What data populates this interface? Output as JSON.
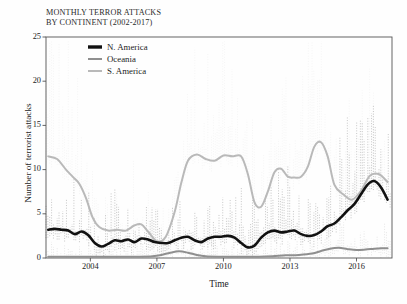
{
  "chart_data": {
    "type": "line",
    "title": "MONTHLY TERROR ATTACKS BY CONTINENT (2002-2017)",
    "title_lines": [
      "MONTHLY TERROR ATTACKS",
      "BY CONTINENT (2002-2017)"
    ],
    "xlabel": "Time",
    "ylabel": "Number of terrorist attacks",
    "xlim": [
      2002.0,
      2017.6
    ],
    "ylim": [
      0,
      25
    ],
    "grid": false,
    "legend_position": "top-left-inside",
    "yticks": [
      0,
      5,
      10,
      15,
      20,
      25
    ],
    "ytick_labels": [
      "0",
      "5",
      "10",
      "15",
      "20",
      "25"
    ],
    "xticks": [
      2004,
      2007,
      2010,
      2013,
      2016
    ],
    "xtick_labels": [
      "2004",
      "2007",
      "2010",
      "2013",
      "2016"
    ],
    "colors": {
      "n_america": "#111111",
      "oceania": "#8f8f8f",
      "s_america": "#b9b9b9",
      "axis": "#555555",
      "raw_na": "#9a9a9a",
      "raw_oc": "#cfcfcf",
      "raw_sa": "#ededed"
    },
    "series": [
      {
        "name": "N. America",
        "color": "#111111",
        "width": 2.6,
        "x": [
          2002.1,
          2002.4,
          2002.7,
          2003.0,
          2003.3,
          2003.6,
          2003.9,
          2004.2,
          2004.5,
          2004.8,
          2005.1,
          2005.4,
          2005.7,
          2006.0,
          2006.3,
          2006.6,
          2006.9,
          2007.2,
          2007.5,
          2007.8,
          2008.1,
          2008.4,
          2008.7,
          2009.0,
          2009.3,
          2009.6,
          2009.9,
          2010.2,
          2010.5,
          2010.8,
          2011.1,
          2011.4,
          2011.7,
          2012.0,
          2012.3,
          2012.6,
          2012.9,
          2013.2,
          2013.5,
          2013.8,
          2014.1,
          2014.4,
          2014.7,
          2015.0,
          2015.3,
          2015.6,
          2015.9,
          2016.2,
          2016.5,
          2016.8,
          2017.1,
          2017.4
        ],
        "y": [
          3.2,
          3.3,
          3.2,
          3.1,
          2.7,
          3.0,
          2.6,
          1.7,
          1.3,
          1.6,
          2.0,
          1.9,
          2.1,
          1.8,
          2.2,
          2.1,
          1.8,
          1.7,
          1.7,
          2.0,
          2.3,
          2.4,
          2.0,
          1.8,
          2.2,
          2.4,
          2.4,
          2.5,
          2.3,
          1.7,
          1.2,
          1.4,
          2.3,
          2.9,
          3.1,
          2.9,
          3.0,
          3.1,
          2.7,
          2.5,
          2.6,
          3.0,
          3.6,
          3.9,
          4.6,
          5.4,
          6.1,
          7.2,
          8.3,
          8.7,
          8.0,
          6.6
        ]
      },
      {
        "name": "Oceania",
        "color": "#8f8f8f",
        "width": 2.0,
        "x": [
          2002.1,
          2002.6,
          2003.2,
          2003.8,
          2004.4,
          2005.0,
          2005.6,
          2006.2,
          2006.8,
          2007.2,
          2007.6,
          2008.0,
          2008.4,
          2008.8,
          2009.2,
          2009.8,
          2010.4,
          2011.0,
          2011.6,
          2012.2,
          2012.8,
          2013.4,
          2014.0,
          2014.4,
          2014.8,
          2015.2,
          2015.6,
          2016.0,
          2016.4,
          2016.8,
          2017.1,
          2017.4
        ],
        "y": [
          0.15,
          0.15,
          0.15,
          0.15,
          0.15,
          0.15,
          0.15,
          0.15,
          0.2,
          0.35,
          0.6,
          0.75,
          0.6,
          0.35,
          0.2,
          0.15,
          0.15,
          0.15,
          0.15,
          0.2,
          0.3,
          0.35,
          0.5,
          0.8,
          1.05,
          1.15,
          1.0,
          0.9,
          0.95,
          1.05,
          1.1,
          1.1
        ]
      },
      {
        "name": "S. America",
        "color": "#b9b9b9",
        "width": 2.0,
        "x": [
          2002.1,
          2002.5,
          2002.9,
          2003.2,
          2003.5,
          2003.8,
          2004.1,
          2004.4,
          2004.8,
          2005.2,
          2005.6,
          2006.0,
          2006.3,
          2006.6,
          2007.0,
          2007.4,
          2007.8,
          2008.1,
          2008.4,
          2008.8,
          2009.2,
          2009.6,
          2010.0,
          2010.4,
          2010.8,
          2011.1,
          2011.4,
          2011.7,
          2012.0,
          2012.3,
          2012.6,
          2012.9,
          2013.2,
          2013.5,
          2013.8,
          2014.1,
          2014.4,
          2014.7,
          2015.0,
          2015.4,
          2015.8,
          2016.2,
          2016.6,
          2017.0,
          2017.4
        ],
        "y": [
          11.5,
          11.2,
          10.0,
          9.2,
          8.4,
          6.8,
          4.6,
          3.5,
          3.1,
          3.2,
          3.1,
          3.7,
          3.8,
          3.0,
          1.9,
          2.4,
          5.2,
          8.5,
          11.0,
          11.7,
          11.2,
          11.0,
          11.6,
          11.5,
          11.5,
          9.5,
          6.3,
          5.8,
          7.5,
          9.7,
          10.1,
          9.2,
          9.1,
          9.2,
          10.3,
          12.6,
          13.1,
          11.5,
          8.3,
          7.2,
          6.6,
          7.6,
          9.3,
          9.5,
          8.6
        ]
      }
    ],
    "raw_spikes": {
      "description": "dotted vertical monthly raw counts behind smoothed curves",
      "n_america_max": 22,
      "s_america_max": 19,
      "oceania_max": 6
    }
  },
  "legend": {
    "items": [
      {
        "label": "N. America",
        "color": "#111111",
        "width": 3.4
      },
      {
        "label": "Oceania",
        "color": "#8f8f8f",
        "width": 2.0
      },
      {
        "label": "S. America",
        "color": "#b9b9b9",
        "width": 2.0
      }
    ]
  }
}
